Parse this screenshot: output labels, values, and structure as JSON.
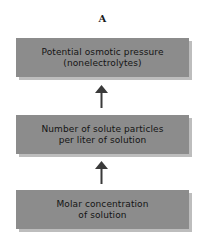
{
  "diagram": {
    "panel_label": "A",
    "boxes": [
      {
        "label": "Potential osmotic pressure\n(nonelectrolytes)"
      },
      {
        "label": "Number of solute particles\nper liter of solution"
      },
      {
        "label": "Molar concentration\nof solution"
      }
    ],
    "arrows": [
      {
        "from": "Number of solute particles per liter of solution",
        "to": "Potential osmotic pressure (nonelectrolytes)",
        "direction": "up"
      },
      {
        "from": "Molar concentration of solution",
        "to": "Number of solute particles per liter of solution",
        "direction": "up"
      }
    ],
    "colors": {
      "box_fill": "#8c8c8c",
      "box_shadow": "#bdbdbd",
      "arrow": "#3a3a3a",
      "text": "#141414"
    }
  }
}
